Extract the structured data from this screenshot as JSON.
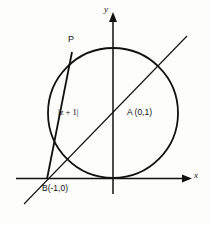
{
  "figure": {
    "kind": "geometry-diagram",
    "axes": {
      "x_label": "x",
      "y_label": "y",
      "origin_label": ""
    },
    "points": [
      {
        "id": "P",
        "label": "P",
        "description": "point on circle, upper left"
      },
      {
        "id": "A",
        "label": "A (0,1)",
        "coords": "(0,1)",
        "description": "point on y-axis, center-right of chord"
      },
      {
        "id": "B",
        "label": "B(-1,0)",
        "coords": "(-1,0)",
        "description": "point on x-axis, left of origin"
      }
    ],
    "segments": [
      {
        "id": "chord-PB",
        "label": "|z + 1|",
        "from": "P",
        "to": "B"
      },
      {
        "id": "line-AB",
        "label": "",
        "from": "B",
        "to": "A",
        "style": "extended-both-ways"
      }
    ],
    "shapes": [
      {
        "id": "circle",
        "type": "circle",
        "label": "",
        "description": "circle passing through origin and B"
      }
    ]
  },
  "ghost_text": {
    "lines": [
      "",
      "",
      "",
      "",
      "",
      ""
    ]
  },
  "colors": {
    "ink": "#111111",
    "paper": "#fdfdfb",
    "ghost": "#cfcec7"
  }
}
